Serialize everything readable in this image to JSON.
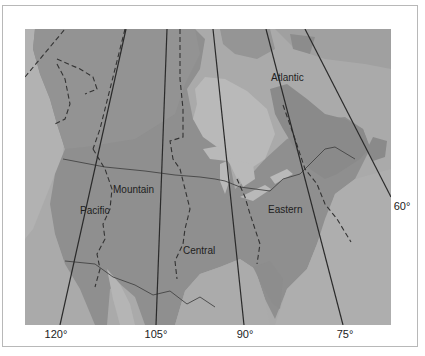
{
  "map": {
    "title": "North American Time Zones",
    "colors": {
      "ocean": "#a9a9a9",
      "land_canada_north": "#8e8e8e",
      "land_us": "#8d8d8d",
      "water_bodies": "#b9b9b9",
      "meridian_line": "#2a2a2a",
      "zone_boundary": "#333333",
      "frame": "#b8b8b8"
    },
    "zones": [
      {
        "name": "Pacific"
      },
      {
        "name": "Mountain"
      },
      {
        "name": "Central"
      },
      {
        "name": "Eastern"
      },
      {
        "name": "Atlantic"
      }
    ],
    "meridians": [
      {
        "label": "120°"
      },
      {
        "label": "105°"
      },
      {
        "label": "90°"
      },
      {
        "label": "75°"
      },
      {
        "label": "60°"
      }
    ]
  }
}
